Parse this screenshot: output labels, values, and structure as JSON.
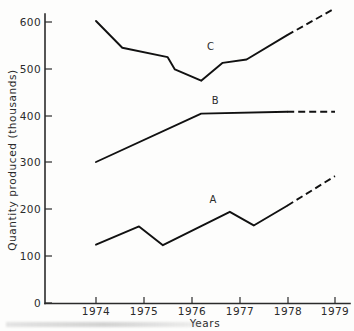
{
  "chart_data": {
    "type": "line",
    "title": "",
    "xlabel": "Years",
    "ylabel": "Quantity produced (thousands)",
    "xlim": [
      1974,
      1979
    ],
    "ylim": [
      0,
      630
    ],
    "grid": false,
    "legend": "inline-labels",
    "x_ticks": [
      "1974",
      "1975",
      "1976",
      "1977",
      "1978",
      "1979"
    ],
    "x_tick_values": [
      1974,
      1975,
      1976,
      1977,
      1978,
      1979
    ],
    "y_ticks": [
      "0",
      "100",
      "200",
      "300",
      "400",
      "500",
      "600"
    ],
    "y_tick_values": [
      0,
      100,
      200,
      300,
      400,
      500,
      600
    ],
    "series": [
      {
        "name": "A",
        "label": "A",
        "label_x": 1976.45,
        "label_y": 212,
        "style": "solid-then-dashed",
        "dashed_from": 1978.0,
        "x": [
          1974.0,
          1974.9,
          1975.4,
          1976.8,
          1977.3,
          1978.0,
          1979.0
        ],
        "values": [
          124,
          163,
          123,
          194,
          165,
          207,
          270
        ]
      },
      {
        "name": "B",
        "label": "B",
        "label_x": 1976.5,
        "label_y": 424,
        "style": "solid-then-dashed",
        "dashed_from": 1978.0,
        "x": [
          1974.0,
          1976.2,
          1978.0,
          1979.0
        ],
        "values": [
          300,
          403,
          407,
          407
        ]
      },
      {
        "name": "C",
        "label": "C",
        "label_x": 1976.4,
        "label_y": 539,
        "style": "solid-then-dashed",
        "dashed_from": 1978.0,
        "x": [
          1974.0,
          1974.55,
          1975.5,
          1975.65,
          1976.2,
          1976.65,
          1977.15,
          1978.0,
          1979.0
        ],
        "values": [
          600,
          543,
          523,
          497,
          473,
          511,
          518,
          570,
          627
        ]
      }
    ]
  },
  "axes": {
    "y_axis_title": "Quantity produced (thousands)",
    "x_axis_title": "Years"
  }
}
